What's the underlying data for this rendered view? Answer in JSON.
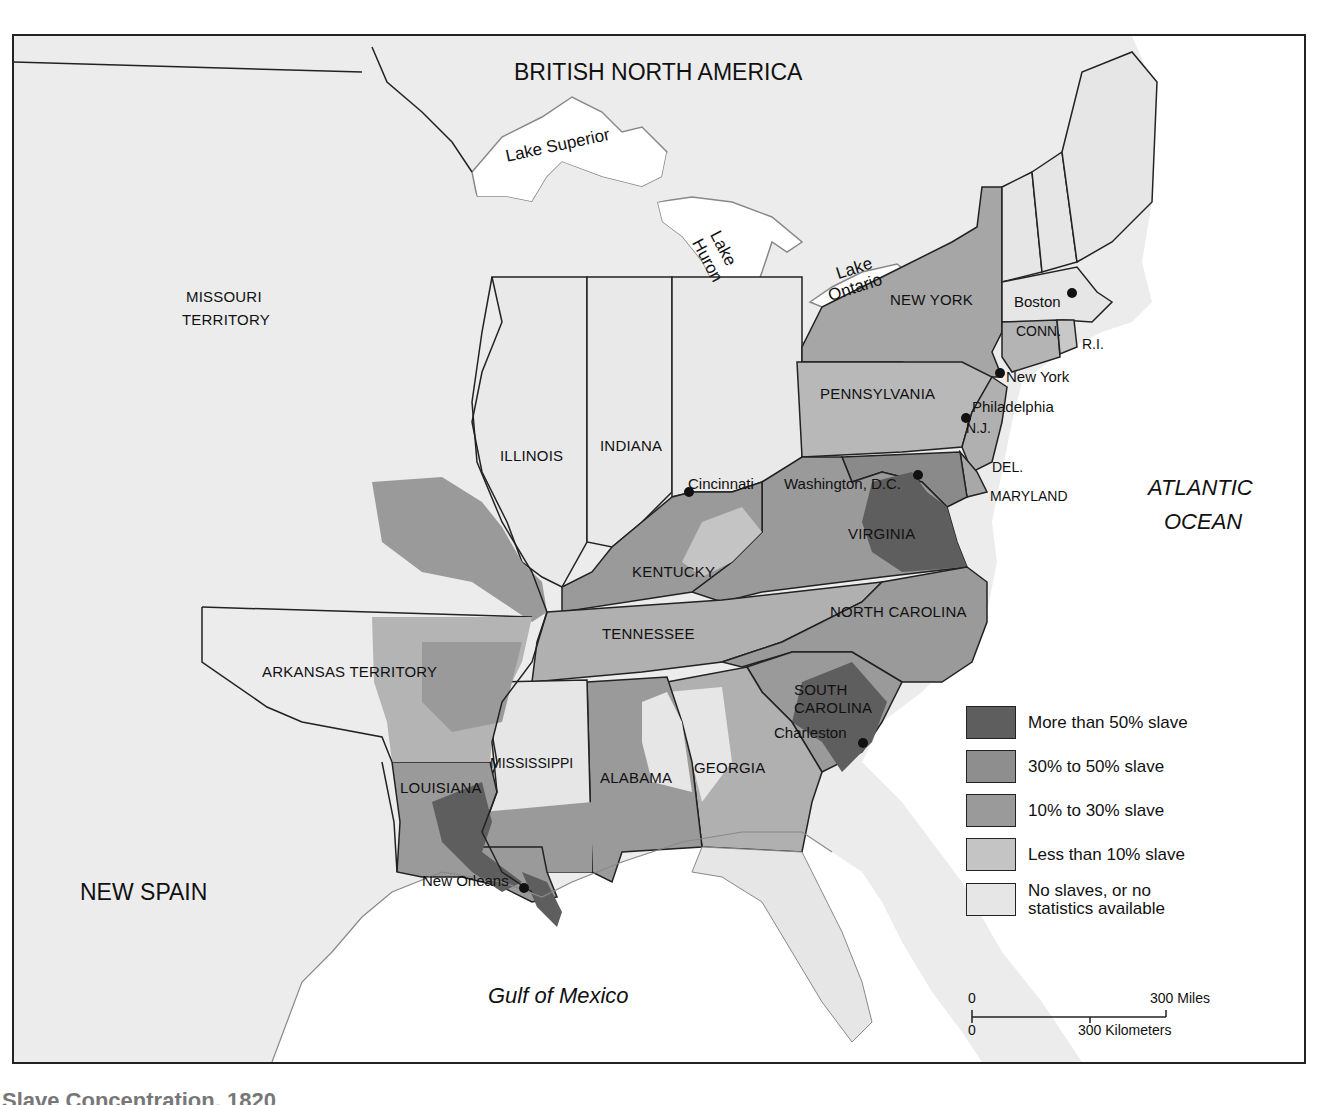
{
  "map": {
    "regions": {
      "british_north_america": "BRITISH NORTH AMERICA",
      "missouri_territory_1": "MISSOURI",
      "missouri_territory_2": "TERRITORY",
      "arkansas_territory": "ARKANSAS TERRITORY",
      "new_spain": "NEW SPAIN"
    },
    "water": {
      "atlantic_1": "ATLANTIC",
      "atlantic_2": "OCEAN",
      "gulf": "Gulf of Mexico",
      "lake_superior": "Lake Superior",
      "lake_huron_1": "Lake",
      "lake_huron_2": "Huron",
      "lake_ontario_1": "Lake",
      "lake_ontario_2": "Ontario"
    },
    "states": {
      "new_york": "NEW YORK",
      "pennsylvania": "PENNSYLVANIA",
      "illinois": "ILLINOIS",
      "indiana": "INDIANA",
      "kentucky": "KENTUCKY",
      "tennessee": "TENNESSEE",
      "virginia": "VIRGINIA",
      "north_carolina": "NORTH CAROLINA",
      "south_carolina_1": "SOUTH",
      "south_carolina_2": "CAROLINA",
      "georgia": "GEORGIA",
      "alabama": "ALABAMA",
      "mississippi": "MISSISSIPPI",
      "louisiana": "LOUISIANA",
      "connecticut": "CONN.",
      "rhode_island": "R.I.",
      "new_jersey": "N.J.",
      "delaware": "DEL.",
      "maryland": "MARYLAND"
    },
    "cities": {
      "boston": "Boston",
      "new_york": "New York",
      "philadelphia": "Philadelphia",
      "washington": "Washington, D.C.",
      "cincinnati": "Cincinnati",
      "charleston": "Charleston",
      "new_orleans": "New Orleans"
    },
    "colors": {
      "more_than_50": "#5e5e5e",
      "from_30_to_50": "#8e8e8e",
      "from_10_to_30": "#9c9c9c",
      "less_than_10": "#c4c4c4",
      "none": "#e6e6e6",
      "water": "#ffffff",
      "background": "#ececec",
      "border": "#222222"
    }
  },
  "legend": {
    "items": [
      {
        "label": "More than 50% slave",
        "color": "#5e5e5e"
      },
      {
        "label": "30% to 50% slave",
        "color": "#8e8e8e"
      },
      {
        "label": "10% to 30% slave",
        "color": "#9a9a9a"
      },
      {
        "label": "Less than 10% slave",
        "color": "#c4c4c4"
      },
      {
        "label": "No slaves, or no statistics available",
        "label_line1": "No slaves, or no",
        "label_line2": "statistics available",
        "color": "#e6e6e6"
      }
    ]
  },
  "scale": {
    "miles_zero": "0",
    "miles_label": "300 Miles",
    "km_zero": "0",
    "km_label": "300 Kilometers"
  },
  "caption": "Slave Concentration, 1820"
}
